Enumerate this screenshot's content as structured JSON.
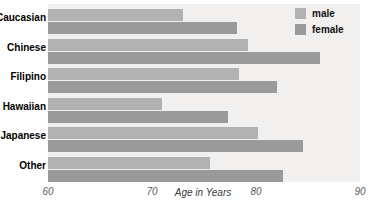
{
  "chart_data": {
    "type": "bar",
    "orientation": "horizontal",
    "title": "",
    "xlabel": "Age in Years",
    "ylabel": "",
    "xlim": [
      60,
      90
    ],
    "xticks": [
      60,
      70,
      80,
      90
    ],
    "xtick_labels": [
      "60",
      "70",
      "80",
      "90"
    ],
    "grid": false,
    "legend_position": "top-right",
    "categories": [
      "Caucasian",
      "Chinese",
      "Filipino",
      "Hawaiian",
      "Japanese",
      "Other"
    ],
    "category_labels_visible": [
      "aucasian",
      "hinese",
      "ilipino",
      "awaiian",
      "apanese",
      "ther"
    ],
    "series": [
      {
        "name": "male",
        "color": "#b2b2b2",
        "values": [
          73.0,
          79.2,
          78.4,
          71.0,
          80.2,
          75.6
        ]
      },
      {
        "name": "female",
        "color": "#9a9a9a",
        "values": [
          78.2,
          86.2,
          82.0,
          77.3,
          84.5,
          82.6
        ]
      }
    ]
  },
  "legend": {
    "items": [
      {
        "label": "male",
        "color": "#b2b2b2"
      },
      {
        "label": "female",
        "color": "#9a9a9a"
      }
    ]
  },
  "axis": {
    "title": "Age in Years",
    "ticks": [
      "60",
      "70",
      "80",
      "90"
    ]
  },
  "colors": {
    "plot_background": "#f1f0ee",
    "page_background": "#ffffff",
    "male": "#b2b2b2",
    "female": "#9a9a9a",
    "tick_text": "#5b5b5b",
    "label_text": "#000000"
  }
}
